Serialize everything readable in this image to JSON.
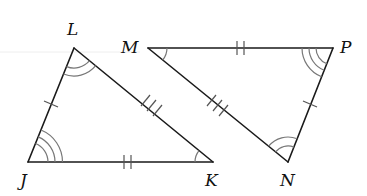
{
  "diagram": {
    "type": "congruent-triangles",
    "triangles": [
      {
        "name": "JKL",
        "vertices": {
          "L": [
            74,
            48
          ],
          "J": [
            28,
            162
          ],
          "K": [
            213,
            162
          ]
        }
      },
      {
        "name": "MNP",
        "vertices": {
          "M": [
            148,
            48
          ],
          "P": [
            333,
            48
          ],
          "N": [
            288,
            162
          ]
        }
      }
    ],
    "labels": {
      "L": "L",
      "M": "M",
      "P": "P",
      "J": "J",
      "K": "K",
      "N": "N"
    },
    "congruence_marks": {
      "single_tick": [
        "JL",
        "PN"
      ],
      "double_tick": [
        "JK",
        "MP"
      ],
      "triple_tick": [
        "LK",
        "MN"
      ],
      "single_arc": [
        "K",
        "M"
      ],
      "double_arc": [
        "L",
        "N"
      ],
      "triple_arc": [
        "J",
        "P"
      ]
    },
    "colors": {
      "edge": "#1a1a1a",
      "mark": "#666666",
      "background": "#ffffff"
    }
  }
}
